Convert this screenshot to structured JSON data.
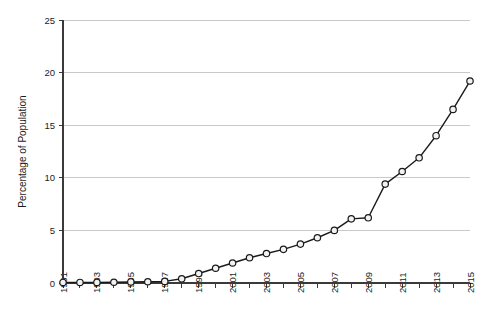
{
  "chart_data": {
    "type": "line",
    "title": "",
    "subtitle": "",
    "xlabel": "",
    "ylabel": "Percentage of Population",
    "xlim": [
      1991,
      2015
    ],
    "ylim": [
      0,
      25
    ],
    "grid": true,
    "legend": "none",
    "marker": "open-circle",
    "x": [
      1991,
      1992,
      1993,
      1994,
      1995,
      1996,
      1997,
      1998,
      1999,
      2000,
      2001,
      2002,
      2003,
      2004,
      2005,
      2006,
      2007,
      2008,
      2009,
      2010,
      2011,
      2012,
      2013,
      2014,
      2015
    ],
    "values": [
      0.05,
      0.05,
      0.05,
      0.07,
      0.1,
      0.12,
      0.15,
      0.4,
      0.9,
      1.4,
      1.9,
      2.4,
      2.8,
      3.2,
      3.7,
      4.3,
      5.0,
      6.1,
      6.2,
      9.4,
      10.6,
      11.9,
      14.0,
      16.5,
      19.2
    ],
    "categories": [
      "1991",
      "1992",
      "1993",
      "1994",
      "1995",
      "1996",
      "1997",
      "1998",
      "1999",
      "2000",
      "2001",
      "2002",
      "2003",
      "2004",
      "2005",
      "2006",
      "2007",
      "2008",
      "2009",
      "2010",
      "2011",
      "2012",
      "2013",
      "2014",
      "2015"
    ],
    "xtick_labels": [
      "1991",
      "1993",
      "1995",
      "1997",
      "1999",
      "2001",
      "2003",
      "2005",
      "2007",
      "2009",
      "2011",
      "2013",
      "2015"
    ],
    "ytick_labels": [
      "0",
      "5",
      "10",
      "15",
      "20",
      "25"
    ],
    "ytick_values": [
      0,
      5,
      10,
      15,
      20,
      25
    ],
    "series": [
      {
        "name": "Percentage of Population",
        "values": [
          0.05,
          0.05,
          0.05,
          0.07,
          0.1,
          0.12,
          0.15,
          0.4,
          0.9,
          1.4,
          1.9,
          2.4,
          2.8,
          3.2,
          3.7,
          4.3,
          5.0,
          6.1,
          6.2,
          9.4,
          10.6,
          11.9,
          14.0,
          16.5,
          19.2
        ]
      }
    ],
    "colors": {
      "line": "#1a1a1a",
      "marker_fill": "#f2f2f2",
      "marker_stroke": "#1a1a1a",
      "grid": "#c9c9c9",
      "axis": "#3a3a3a",
      "text": "#1c1c1c",
      "background": "#ffffff"
    }
  }
}
